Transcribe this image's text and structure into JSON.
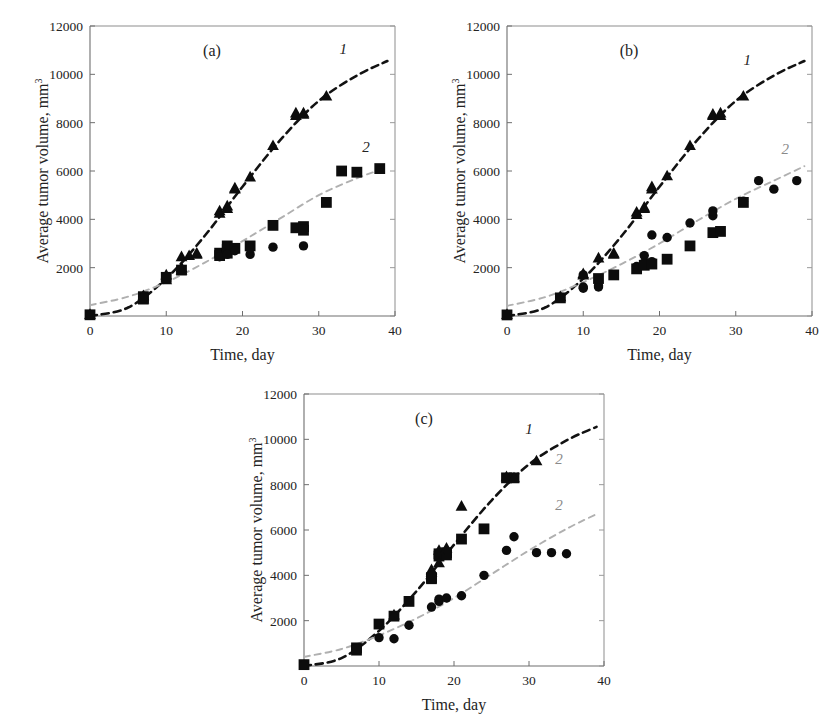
{
  "figure": {
    "axis": {
      "x_label": "Time, day",
      "y_label_main": "Average tumor volume, mm",
      "y_label_exponent": "3",
      "x_ticks": [
        "0",
        "10",
        "20",
        "30",
        "40"
      ],
      "y_ticks": [
        "0",
        "2000",
        "4000",
        "6000",
        "8000",
        "10000",
        "12000"
      ],
      "xlim": [
        0,
        40
      ],
      "ylim": [
        0,
        12000
      ]
    },
    "panels": [
      {
        "id": "a",
        "letter": "(a)",
        "curve_labels": [
          {
            "text": "1",
            "faint": false
          },
          {
            "text": "2",
            "faint": false
          }
        ]
      },
      {
        "id": "b",
        "letter": "(b)",
        "curve_labels": [
          {
            "text": "1",
            "faint": false
          },
          {
            "text": "2",
            "faint": true
          }
        ]
      },
      {
        "id": "c",
        "letter": "(c)",
        "curve_labels": [
          {
            "text": "1",
            "faint": false
          },
          {
            "text": "2",
            "faint": true
          },
          {
            "text": "2",
            "faint": true
          }
        ]
      }
    ]
  },
  "chart_data": [
    {
      "panel": "a",
      "type": "scatter",
      "title": "(a)",
      "xlabel": "Time, day",
      "ylabel": "Average tumor volume, mm3",
      "xlim": [
        0,
        40
      ],
      "ylim": [
        0,
        12000
      ],
      "grid": false,
      "legend_position": "inline-curve-labels",
      "annotations": [
        {
          "text": "1",
          "x": 33.2,
          "y": 10850,
          "italic": true
        },
        {
          "text": "2",
          "x": 36.2,
          "y": 6800,
          "italic": true
        }
      ],
      "series": [
        {
          "name": "1",
          "marker": "triangle",
          "color": "#0c0c0c",
          "points": [
            [
              0,
              60
            ],
            [
              7,
              840
            ],
            [
              7,
              700
            ],
            [
              10,
              1700
            ],
            [
              10,
              1500
            ],
            [
              12,
              2000
            ],
            [
              12,
              1900
            ],
            [
              12,
              2450
            ],
            [
              13,
              2500
            ],
            [
              14,
              2600
            ],
            [
              14,
              2550
            ],
            [
              17,
              4350
            ],
            [
              17,
              4250
            ],
            [
              18,
              4550
            ],
            [
              18,
              4450
            ],
            [
              19,
              5250
            ],
            [
              19,
              5300
            ],
            [
              21,
              5750
            ],
            [
              24,
              7050
            ],
            [
              27,
              8300
            ],
            [
              27,
              8400
            ],
            [
              28,
              8350
            ],
            [
              28,
              8400
            ],
            [
              31,
              9100
            ]
          ]
        },
        {
          "name": "2",
          "marker": "square",
          "color": "#0c0c0c",
          "points": [
            [
              0,
              50
            ],
            [
              7,
              800
            ],
            [
              7,
              700
            ],
            [
              10,
              1600
            ],
            [
              12,
              1900
            ],
            [
              17,
              2600
            ],
            [
              17,
              2500
            ],
            [
              18,
              2750
            ],
            [
              18,
              2600
            ],
            [
              18,
              2900
            ],
            [
              19,
              2800
            ],
            [
              21,
              2900
            ],
            [
              24,
              3750
            ],
            [
              27,
              3650
            ],
            [
              28,
              3700
            ],
            [
              28,
              3550
            ],
            [
              31,
              4700
            ],
            [
              33,
              6000
            ],
            [
              35,
              5950
            ],
            [
              38,
              6100
            ]
          ]
        },
        {
          "name": "2b",
          "marker": "circle",
          "color": "#0c0c0c",
          "points": [
            [
              0,
              40
            ],
            [
              7,
              750
            ],
            [
              17,
              2450
            ],
            [
              18,
              2550
            ],
            [
              19,
              2700
            ],
            [
              21,
              2550
            ],
            [
              21,
              2800
            ],
            [
              24,
              2850
            ],
            [
              28,
              2900
            ]
          ]
        }
      ],
      "fit_curves": [
        {
          "name": "1",
          "style": "dashed-dark",
          "points": [
            [
              0,
              0
            ],
            [
              5,
              350
            ],
            [
              10,
              1550
            ],
            [
              15,
              3300
            ],
            [
              20,
              5350
            ],
            [
              25,
              7300
            ],
            [
              30,
              8900
            ],
            [
              35,
              9950
            ],
            [
              39,
              10550
            ]
          ]
        },
        {
          "name": "2",
          "style": "dashed-light",
          "points": [
            [
              0,
              450
            ],
            [
              5,
              800
            ],
            [
              10,
              1400
            ],
            [
              15,
              2200
            ],
            [
              20,
              3100
            ],
            [
              25,
              4050
            ],
            [
              30,
              5000
            ],
            [
              35,
              5700
            ],
            [
              39,
              6150
            ]
          ]
        }
      ]
    },
    {
      "panel": "b",
      "type": "scatter",
      "title": "(b)",
      "xlabel": "Time, day",
      "ylabel": "Average tumor volume, mm3",
      "xlim": [
        0,
        40
      ],
      "ylim": [
        0,
        12000
      ],
      "grid": false,
      "legend_position": "inline-curve-labels",
      "annotations": [
        {
          "text": "1",
          "x": 31.5,
          "y": 10400,
          "italic": true
        },
        {
          "text": "2",
          "x": 36.5,
          "y": 6700,
          "italic": true
        }
      ],
      "series": [
        {
          "name": "1",
          "marker": "triangle",
          "color": "#0c0c0c",
          "points": [
            [
              0,
              60
            ],
            [
              7,
              800
            ],
            [
              10,
              1750
            ],
            [
              10,
              1700
            ],
            [
              12,
              2400
            ],
            [
              14,
              2550
            ],
            [
              14,
              2600
            ],
            [
              17,
              4300
            ],
            [
              17,
              4200
            ],
            [
              18,
              4450
            ],
            [
              18,
              4500
            ],
            [
              19,
              5250
            ],
            [
              19,
              5350
            ],
            [
              21,
              5800
            ],
            [
              24,
              7050
            ],
            [
              27,
              8300
            ],
            [
              27,
              8350
            ],
            [
              28,
              8300
            ],
            [
              28,
              8400
            ],
            [
              31,
              9100
            ]
          ]
        },
        {
          "name": "2",
          "marker": "circle",
          "color": "#0c0c0c",
          "points": [
            [
              0,
              50
            ],
            [
              7,
              780
            ],
            [
              10,
              1700
            ],
            [
              10,
              1200
            ],
            [
              10,
              1150
            ],
            [
              12,
              1250
            ],
            [
              12,
              1200
            ],
            [
              14,
              1700
            ],
            [
              17,
              2050
            ],
            [
              18,
              2200
            ],
            [
              18,
              2500
            ],
            [
              19,
              2250
            ],
            [
              19,
              3350
            ],
            [
              21,
              3250
            ],
            [
              24,
              3850
            ],
            [
              27,
              4150
            ],
            [
              27,
              4350
            ],
            [
              31,
              4750
            ],
            [
              33,
              5600
            ],
            [
              35,
              5250
            ],
            [
              38,
              5600
            ]
          ]
        },
        {
          "name": "2b",
          "marker": "square",
          "color": "#0c0c0c",
          "points": [
            [
              0,
              45
            ],
            [
              7,
              750
            ],
            [
              12,
              1550
            ],
            [
              14,
              1700
            ],
            [
              17,
              1950
            ],
            [
              18,
              2100
            ],
            [
              19,
              2150
            ],
            [
              21,
              2350
            ],
            [
              24,
              2900
            ],
            [
              27,
              3450
            ],
            [
              28,
              3500
            ],
            [
              31,
              4700
            ]
          ]
        }
      ],
      "fit_curves": [
        {
          "name": "1",
          "style": "dashed-dark",
          "points": [
            [
              0,
              0
            ],
            [
              5,
              350
            ],
            [
              10,
              1550
            ],
            [
              15,
              3300
            ],
            [
              20,
              5350
            ],
            [
              25,
              7300
            ],
            [
              30,
              8900
            ],
            [
              35,
              9950
            ],
            [
              39,
              10550
            ]
          ]
        },
        {
          "name": "2",
          "style": "dashed-light",
          "points": [
            [
              0,
              420
            ],
            [
              5,
              780
            ],
            [
              10,
              1400
            ],
            [
              15,
              2150
            ],
            [
              20,
              3000
            ],
            [
              25,
              3950
            ],
            [
              30,
              4850
            ],
            [
              35,
              5600
            ],
            [
              39,
              6200
            ]
          ]
        }
      ]
    },
    {
      "panel": "c",
      "type": "scatter",
      "title": "(c)",
      "xlabel": "Time, day",
      "ylabel": "Average tumor volume, mm3",
      "xlim": [
        0,
        40
      ],
      "ylim": [
        0,
        12000
      ],
      "grid": false,
      "legend_position": "inline-curve-labels",
      "annotations": [
        {
          "text": "1",
          "x": 30.0,
          "y": 10250,
          "italic": true
        },
        {
          "text": "2",
          "x": 34.0,
          "y": 8900,
          "italic": true
        },
        {
          "text": "2",
          "x": 34.0,
          "y": 6900,
          "italic": true
        }
      ],
      "series": [
        {
          "name": "1",
          "marker": "square",
          "color": "#0c0c0c",
          "points": [
            [
              0,
              60
            ],
            [
              7,
              800
            ],
            [
              7,
              700
            ],
            [
              10,
              1850
            ],
            [
              12,
              2200
            ],
            [
              14,
              2850
            ],
            [
              17,
              3900
            ],
            [
              17,
              3850
            ],
            [
              18,
              4850
            ],
            [
              18,
              4950
            ],
            [
              19,
              5000
            ],
            [
              19,
              4900
            ],
            [
              21,
              5600
            ],
            [
              24,
              6050
            ],
            [
              27,
              8300
            ],
            [
              28,
              8300
            ]
          ]
        },
        {
          "name": "1b",
          "marker": "triangle",
          "color": "#0c0c0c",
          "points": [
            [
              12,
              2250
            ],
            [
              17,
              4250
            ],
            [
              17,
              4150
            ],
            [
              18,
              4550
            ],
            [
              18,
              5100
            ],
            [
              19,
              5200
            ],
            [
              21,
              7050
            ],
            [
              27,
              8350
            ],
            [
              28,
              8300
            ],
            [
              31,
              9050
            ]
          ]
        },
        {
          "name": "2",
          "marker": "circle",
          "color": "#0c0c0c",
          "points": [
            [
              0,
              40
            ],
            [
              7,
              750
            ],
            [
              10,
              1250
            ],
            [
              12,
              1200
            ],
            [
              14,
              1800
            ],
            [
              17,
              2600
            ],
            [
              18,
              2850
            ],
            [
              18,
              2950
            ],
            [
              19,
              3000
            ],
            [
              21,
              3100
            ],
            [
              24,
              4000
            ],
            [
              27,
              5100
            ],
            [
              28,
              5700
            ],
            [
              31,
              5000
            ],
            [
              33,
              5000
            ],
            [
              35,
              4950
            ]
          ]
        }
      ],
      "fit_curves": [
        {
          "name": "1",
          "style": "dashed-dark",
          "points": [
            [
              0,
              0
            ],
            [
              5,
              350
            ],
            [
              10,
              1550
            ],
            [
              15,
              3300
            ],
            [
              20,
              5350
            ],
            [
              25,
              7300
            ],
            [
              30,
              8900
            ],
            [
              35,
              9950
            ],
            [
              39,
              10550
            ]
          ]
        },
        {
          "name": "2",
          "style": "dashed-light",
          "points": [
            [
              0,
              400
            ],
            [
              5,
              750
            ],
            [
              10,
              1350
            ],
            [
              15,
              2100
            ],
            [
              20,
              3000
            ],
            [
              25,
              4050
            ],
            [
              30,
              5100
            ],
            [
              35,
              6050
            ],
            [
              39,
              6700
            ]
          ]
        }
      ]
    }
  ]
}
